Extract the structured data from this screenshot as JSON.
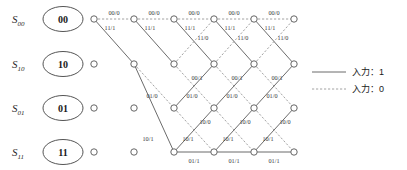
{
  "diagram": {
    "type": "trellis",
    "title": "",
    "states": [
      {
        "name": "S",
        "sub": "00",
        "value": "00",
        "row": 0
      },
      {
        "name": "S",
        "sub": "10",
        "value": "10",
        "row": 1
      },
      {
        "name": "S",
        "sub": "01",
        "value": "01",
        "row": 2
      },
      {
        "name": "S",
        "sub": "11",
        "value": "11",
        "row": 3
      }
    ],
    "columns": 6,
    "geometry": {
      "col_x": [
        94,
        134,
        174,
        214,
        254,
        294
      ],
      "row_y": [
        19,
        64,
        108,
        152
      ],
      "node_r": 3.2
    },
    "nodes": [
      {
        "col": 0,
        "row": 0,
        "active": true
      },
      {
        "col": 0,
        "row": 1,
        "active": false
      },
      {
        "col": 0,
        "row": 2,
        "active": false
      },
      {
        "col": 0,
        "row": 3,
        "active": false
      },
      {
        "col": 1,
        "row": 0,
        "active": true
      },
      {
        "col": 1,
        "row": 1,
        "active": true
      },
      {
        "col": 1,
        "row": 2,
        "active": false
      },
      {
        "col": 1,
        "row": 3,
        "active": false
      },
      {
        "col": 2,
        "row": 0,
        "active": true
      },
      {
        "col": 2,
        "row": 1,
        "active": true
      },
      {
        "col": 2,
        "row": 2,
        "active": true
      },
      {
        "col": 2,
        "row": 3,
        "active": true
      },
      {
        "col": 3,
        "row": 0,
        "active": true
      },
      {
        "col": 3,
        "row": 1,
        "active": true
      },
      {
        "col": 3,
        "row": 2,
        "active": true
      },
      {
        "col": 3,
        "row": 3,
        "active": true
      },
      {
        "col": 4,
        "row": 0,
        "active": true
      },
      {
        "col": 4,
        "row": 1,
        "active": true
      },
      {
        "col": 4,
        "row": 2,
        "active": true
      },
      {
        "col": 4,
        "row": 3,
        "active": true
      },
      {
        "col": 5,
        "row": 0,
        "active": true
      },
      {
        "col": 5,
        "row": 1,
        "active": true
      },
      {
        "col": 5,
        "row": 2,
        "active": true
      },
      {
        "col": 5,
        "row": 3,
        "active": true
      }
    ],
    "edges": [
      {
        "col": 0,
        "from": 0,
        "to": 0,
        "input": 0,
        "label": "00/0",
        "lx": 114,
        "ly": 15,
        "anchor": "middle"
      },
      {
        "col": 0,
        "from": 0,
        "to": 1,
        "input": 1,
        "label": "11/1",
        "lx": 110,
        "ly": 30,
        "anchor": "middle"
      },
      {
        "col": 1,
        "from": 0,
        "to": 0,
        "input": 0,
        "label": "00/0",
        "lx": 154,
        "ly": 15,
        "anchor": "middle"
      },
      {
        "col": 1,
        "from": 0,
        "to": 1,
        "input": 1,
        "label": "11/1",
        "lx": 150,
        "ly": 30,
        "anchor": "middle"
      },
      {
        "col": 1,
        "from": 1,
        "to": 2,
        "input": 0,
        "label": "01/0",
        "lx": 152,
        "ly": 98,
        "anchor": "middle"
      },
      {
        "col": 1,
        "from": 1,
        "to": 3,
        "input": 1,
        "label": "10/1",
        "lx": 148,
        "ly": 141,
        "anchor": "middle"
      },
      {
        "col": 2,
        "from": 0,
        "to": 0,
        "input": 0,
        "label": "00/0",
        "lx": 194,
        "ly": 15,
        "anchor": "middle"
      },
      {
        "col": 2,
        "from": 0,
        "to": 1,
        "input": 1,
        "label": "11/1",
        "lx": 190,
        "ly": 30,
        "anchor": "middle"
      },
      {
        "col": 2,
        "from": 1,
        "to": 0,
        "input": 0,
        "label": "11/0",
        "lx": 203,
        "ly": 40,
        "anchor": "middle"
      },
      {
        "col": 2,
        "from": 1,
        "to": 2,
        "input": 0,
        "label": "01/0",
        "lx": 192,
        "ly": 98,
        "anchor": "middle"
      },
      {
        "col": 2,
        "from": 2,
        "to": 1,
        "input": 1,
        "label": "00/1",
        "lx": 197,
        "ly": 80,
        "anchor": "middle"
      },
      {
        "col": 2,
        "from": 2,
        "to": 3,
        "input": 0,
        "label": "10/0",
        "lx": 205,
        "ly": 124,
        "anchor": "middle"
      },
      {
        "col": 2,
        "from": 3,
        "to": 3,
        "input": 1,
        "label": "01/1",
        "lx": 194,
        "ly": 163,
        "anchor": "middle"
      },
      {
        "col": 2,
        "from": 3,
        "to": 2,
        "input": 1,
        "label": "10/1",
        "lx": 188,
        "ly": 141,
        "anchor": "middle"
      },
      {
        "col": 3,
        "from": 0,
        "to": 0,
        "input": 0,
        "label": "00/0",
        "lx": 234,
        "ly": 15,
        "anchor": "middle"
      },
      {
        "col": 3,
        "from": 0,
        "to": 1,
        "input": 1,
        "label": "11/1",
        "lx": 230,
        "ly": 30,
        "anchor": "middle"
      },
      {
        "col": 3,
        "from": 1,
        "to": 0,
        "input": 0,
        "label": "11/0",
        "lx": 243,
        "ly": 40,
        "anchor": "middle"
      },
      {
        "col": 3,
        "from": 1,
        "to": 2,
        "input": 0,
        "label": "01/0",
        "lx": 232,
        "ly": 98,
        "anchor": "middle"
      },
      {
        "col": 3,
        "from": 2,
        "to": 1,
        "input": 1,
        "label": "00/1",
        "lx": 237,
        "ly": 80,
        "anchor": "middle"
      },
      {
        "col": 3,
        "from": 2,
        "to": 3,
        "input": 0,
        "label": "10/0",
        "lx": 245,
        "ly": 124,
        "anchor": "middle"
      },
      {
        "col": 3,
        "from": 3,
        "to": 3,
        "input": 1,
        "label": "01/1",
        "lx": 234,
        "ly": 163,
        "anchor": "middle"
      },
      {
        "col": 3,
        "from": 3,
        "to": 2,
        "input": 1,
        "label": "10/1",
        "lx": 228,
        "ly": 141,
        "anchor": "middle"
      },
      {
        "col": 4,
        "from": 0,
        "to": 0,
        "input": 0,
        "label": "00/0",
        "lx": 274,
        "ly": 15,
        "anchor": "middle"
      },
      {
        "col": 4,
        "from": 0,
        "to": 1,
        "input": 1,
        "label": "11/1",
        "lx": 270,
        "ly": 30,
        "anchor": "middle"
      },
      {
        "col": 4,
        "from": 1,
        "to": 0,
        "input": 0,
        "label": "11/0",
        "lx": 283,
        "ly": 40,
        "anchor": "middle"
      },
      {
        "col": 4,
        "from": 1,
        "to": 2,
        "input": 0,
        "label": "01/0",
        "lx": 272,
        "ly": 98,
        "anchor": "middle"
      },
      {
        "col": 4,
        "from": 2,
        "to": 1,
        "input": 1,
        "label": "00/1",
        "lx": 277,
        "ly": 80,
        "anchor": "middle"
      },
      {
        "col": 4,
        "from": 2,
        "to": 3,
        "input": 0,
        "label": "10/0",
        "lx": 285,
        "ly": 124,
        "anchor": "middle"
      },
      {
        "col": 4,
        "from": 3,
        "to": 3,
        "input": 1,
        "label": "01/1",
        "lx": 274,
        "ly": 163,
        "anchor": "middle"
      },
      {
        "col": 4,
        "from": 3,
        "to": 2,
        "input": 1,
        "label": "10/1",
        "lx": 268,
        "ly": 141,
        "anchor": "middle"
      }
    ]
  },
  "legend": {
    "items": [
      {
        "label": "入力：1",
        "style": "solid",
        "input": "1"
      },
      {
        "label": "入力：0",
        "style": "dashed",
        "input": "0"
      }
    ],
    "x": 312,
    "y": 72,
    "row_gap": 17
  },
  "colors": {
    "solid_edge": "#5a5a5a",
    "dashed_edge": "#8a8a8a",
    "node_stroke": "#666666",
    "text": "#1a1a1a",
    "background": "#ffffff"
  }
}
